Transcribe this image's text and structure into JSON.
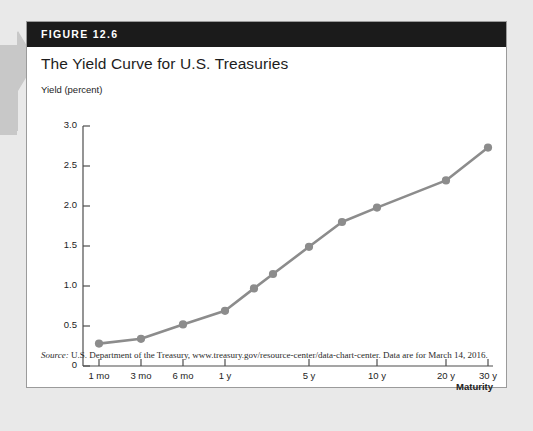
{
  "figure": {
    "number_label": "FIGURE 12.6",
    "title": "The Yield Curve for U.S. Treasuries",
    "source_prefix": "Source:",
    "source_text": " U.S. Department of the Treasury, www.treasury.gov/resource-center/data-chart-center. Data are for March 14, 2016."
  },
  "colors": {
    "band": "#1b1b1b",
    "series": "#8c8c8c",
    "axis": "#4d4d4d",
    "page": "#e9e9e9",
    "card": "#ffffff",
    "margin_arrow": "#c8c8c8"
  },
  "chart_data": {
    "type": "line",
    "title": "The Yield Curve for U.S. Treasuries",
    "xlabel": "Maturity",
    "ylabel": "Yield (percent)",
    "ylim": [
      0,
      3.0
    ],
    "yticks": [
      "0",
      "0.5",
      "1.0",
      "1.5",
      "2.0",
      "2.5",
      "3.0"
    ],
    "ytick_values": [
      0,
      0.5,
      1.0,
      1.5,
      2.0,
      2.5,
      3.0
    ],
    "xticks": [
      "1 mo",
      "3 mo",
      "6 mo",
      "1 y",
      "5 y",
      "10 y",
      "20 y",
      "30 y"
    ],
    "grid": false,
    "legend": "none",
    "series_name": "U.S. Treasury yield",
    "categories": [
      "1 mo",
      "3 mo",
      "6 mo",
      "1 y",
      "2 y",
      "3 y",
      "5 y",
      "7 y",
      "10 y",
      "20 y",
      "30 y"
    ],
    "values": [
      0.28,
      0.34,
      0.52,
      0.69,
      0.97,
      1.15,
      1.49,
      1.8,
      1.98,
      2.32,
      2.73
    ],
    "points_px": [
      {
        "label": "1 mo",
        "x": 58,
        "y": 0.28
      },
      {
        "label": "3 mo",
        "x": 100,
        "y": 0.34
      },
      {
        "label": "6 mo",
        "x": 142,
        "y": 0.52
      },
      {
        "label": "1 y",
        "x": 184,
        "y": 0.69
      },
      {
        "label": "2 y",
        "x": 213,
        "y": 0.97
      },
      {
        "label": "3 y",
        "x": 232,
        "y": 1.15
      },
      {
        "label": "5 y",
        "x": 268,
        "y": 1.49
      },
      {
        "label": "7 y",
        "x": 301,
        "y": 1.8
      },
      {
        "label": "10 y",
        "x": 336,
        "y": 1.98
      },
      {
        "label": "20 y",
        "x": 405,
        "y": 2.32
      },
      {
        "label": "30 y",
        "x": 447,
        "y": 2.73
      }
    ],
    "xtick_px": [
      58,
      100,
      142,
      184,
      268,
      336,
      405,
      447
    ]
  }
}
